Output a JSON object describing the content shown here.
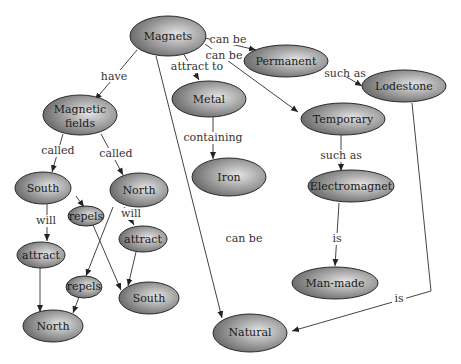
{
  "diagram": {
    "type": "concept-map",
    "colors": {
      "node_light": "#e4e4e4",
      "node_dark": "#6e6e6e",
      "stroke": "#2a2a2a",
      "background": "#ffffff"
    },
    "nodes": {
      "magnets": "Magnets",
      "permanent": "Permanent",
      "lodestone": "Lodestone",
      "metal": "Metal",
      "iron": "Iron",
      "temporary": "Temporary",
      "electromagnet": "Electromagnet",
      "man_made": "Man-made",
      "natural": "Natural",
      "magnetic_fields_1": "Magnetic",
      "magnetic_fields_2": "fields",
      "south_top": "South",
      "north_top": "North",
      "repels_1": "repels",
      "attract_1": "attract",
      "attract_2": "attract",
      "repels_2": "repels",
      "south_bottom": "South",
      "north_bottom": "North"
    },
    "edges": {
      "magnets_permanent": "can be",
      "magnets_temporary": "can be",
      "magnets_metal": "attract to",
      "magnets_fields": "have",
      "magnets_natural": "can be",
      "permanent_lodestone": "such as",
      "metal_iron": "containing",
      "temporary_electromagnet": "such as",
      "electromagnet_manmade": "is",
      "lodestone_natural": "is",
      "fields_south": "called",
      "fields_north": "called",
      "south_attract": "will",
      "north_attract": "will"
    }
  }
}
